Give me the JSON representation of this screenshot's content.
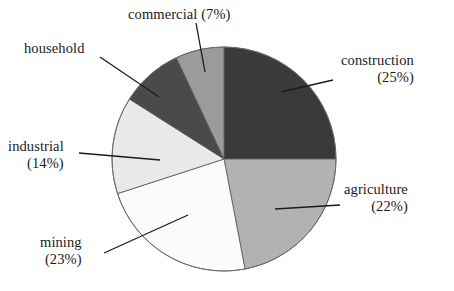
{
  "figure": {
    "background_color": "#ffffff",
    "text_color": "#1b1b1b",
    "leader_line_color": "#1b1b1b",
    "slice_outline_color": "#555555"
  },
  "chart_data": {
    "type": "pie",
    "title": "",
    "subtitle": "",
    "xlabel": "",
    "ylabel": "",
    "legend_position": "none",
    "grid": false,
    "labels_show_percent": true,
    "start_angle_deg": 0,
    "direction": "clockwise",
    "center": {
      "x": 224,
      "y": 159,
      "radius": 112
    },
    "categories": [
      "construction",
      "agriculture",
      "mining",
      "industrial",
      "household",
      "commercial"
    ],
    "values": [
      25,
      22,
      23,
      14,
      9,
      7
    ],
    "colors": [
      "#3a3a3a",
      "#b2b2b2",
      "#fbfbfb",
      "#e9e9e9",
      "#4a4a4a",
      "#9b9b9b"
    ],
    "slices": [
      {
        "name": "construction",
        "percent": 25,
        "color": "#3a3a3a",
        "start_deg": 0,
        "end_deg": 90
      },
      {
        "name": "agriculture",
        "percent": 22,
        "color": "#b2b2b2",
        "start_deg": 90,
        "end_deg": 169.2
      },
      {
        "name": "mining",
        "percent": 23,
        "color": "#fbfbfb",
        "start_deg": 169.2,
        "end_deg": 252
      },
      {
        "name": "industrial",
        "percent": 14,
        "color": "#e9e9e9",
        "start_deg": 252,
        "end_deg": 302.4
      },
      {
        "name": "household",
        "percent": 9,
        "color": "#4a4a4a",
        "start_deg": 302.4,
        "end_deg": 334.8
      },
      {
        "name": "commercial",
        "percent": 7,
        "color": "#9b9b9b",
        "start_deg": 334.8,
        "end_deg": 360
      }
    ]
  },
  "labels": {
    "commercial": {
      "line1": "commercial (7%)",
      "line2": ""
    },
    "household": {
      "line1": "household",
      "line2": ""
    },
    "industrial": {
      "line1": "industrial",
      "line2": "(14%)"
    },
    "mining": {
      "line1": "mining",
      "line2": "(23%)"
    },
    "construction": {
      "line1": "construction",
      "line2": "(25%)"
    },
    "agriculture": {
      "line1": "agriculture",
      "line2": "(22%)"
    }
  }
}
